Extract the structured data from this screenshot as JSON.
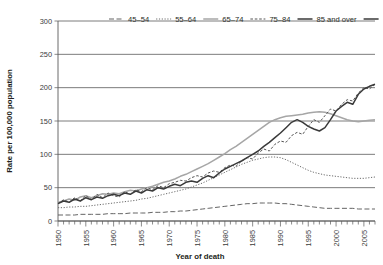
{
  "chart_data": {
    "type": "line",
    "title": "",
    "xlabel": "Year of death",
    "ylabel": "Rate per 100,000 population",
    "xlim": [
      1950,
      2007
    ],
    "ylim": [
      0,
      300
    ],
    "ytick_values": [
      0,
      50,
      100,
      150,
      200,
      250,
      300
    ],
    "ytick_labels": [
      "0",
      "50",
      "100",
      "150",
      "200",
      "250",
      "300"
    ],
    "xtick_labels": [
      "1950",
      "1955",
      "1960",
      "1965",
      "1970",
      "1975",
      "1980",
      "1985",
      "1990",
      "1995",
      "2000",
      "2005"
    ],
    "xtick_values": [
      1950,
      1955,
      1960,
      1965,
      1970,
      1975,
      1980,
      1985,
      1990,
      1995,
      2000,
      2005
    ],
    "minor_tick_step": 1,
    "grid": "horizontal",
    "legend_position": "top",
    "x": [
      1950,
      1951,
      1952,
      1953,
      1954,
      1955,
      1956,
      1957,
      1958,
      1959,
      1960,
      1961,
      1962,
      1963,
      1964,
      1965,
      1966,
      1967,
      1968,
      1969,
      1970,
      1971,
      1972,
      1973,
      1974,
      1975,
      1976,
      1977,
      1978,
      1979,
      1980,
      1981,
      1982,
      1983,
      1984,
      1985,
      1986,
      1987,
      1988,
      1989,
      1990,
      1991,
      1992,
      1993,
      1994,
      1995,
      1996,
      1997,
      1998,
      1999,
      2000,
      2001,
      2002,
      2003,
      2004,
      2005,
      2006,
      2007
    ],
    "series": [
      {
        "name": "45-54",
        "label": "45–54",
        "color": "#5c5c5c",
        "dash": "5,2.5",
        "width": 0.95,
        "values": [
          9,
          9,
          9,
          9,
          10,
          10,
          10,
          10,
          10,
          11,
          11,
          11,
          11,
          12,
          12,
          12,
          12,
          13,
          13,
          13,
          14,
          14,
          15,
          15,
          16,
          17,
          18,
          19,
          20,
          21,
          22,
          23,
          24,
          25,
          26,
          26,
          27,
          27,
          27,
          27,
          26,
          26,
          25,
          24,
          23,
          22,
          21,
          20,
          19,
          19,
          19,
          19,
          19,
          19,
          18,
          18,
          18,
          18
        ]
      },
      {
        "name": "55-64",
        "label": "55–64",
        "color": "#6b6b6b",
        "dash": "1.2,1.6",
        "width": 1.0,
        "values": [
          20,
          20,
          21,
          21,
          22,
          22,
          23,
          24,
          25,
          26,
          27,
          28,
          29,
          30,
          31,
          33,
          34,
          36,
          38,
          40,
          42,
          44,
          46,
          48,
          51,
          54,
          57,
          61,
          65,
          69,
          73,
          77,
          81,
          85,
          88,
          91,
          93,
          95,
          96,
          96,
          95,
          92,
          88,
          84,
          80,
          76,
          73,
          71,
          69,
          68,
          67,
          66,
          65,
          64,
          64,
          64,
          65,
          66
        ]
      },
      {
        "name": "65-74",
        "label": "65–74",
        "color": "#a6a6a6",
        "dash": "none",
        "width": 1.5,
        "values": [
          28,
          30,
          33,
          31,
          36,
          38,
          35,
          38,
          41,
          40,
          42,
          41,
          44,
          46,
          45,
          48,
          50,
          52,
          55,
          58,
          60,
          63,
          67,
          70,
          74,
          78,
          82,
          86,
          91,
          96,
          101,
          107,
          112,
          118,
          124,
          130,
          136,
          142,
          148,
          152,
          155,
          157,
          158,
          159,
          160,
          162,
          163,
          164,
          163,
          161,
          158,
          155,
          152,
          150,
          149,
          150,
          151,
          152
        ]
      },
      {
        "name": "75-84",
        "label": "75–84",
        "color": "#555555",
        "dash": "2.6,1.8",
        "width": 1.0,
        "values": [
          26,
          32,
          28,
          35,
          30,
          38,
          32,
          40,
          35,
          42,
          38,
          36,
          44,
          40,
          47,
          44,
          50,
          47,
          53,
          50,
          56,
          58,
          61,
          60,
          65,
          68,
          66,
          72,
          75,
          73,
          80,
          84,
          82,
          90,
          95,
          93,
          102,
          108,
          105,
          115,
          120,
          118,
          128,
          133,
          130,
          142,
          152,
          148,
          158,
          168,
          165,
          175,
          182,
          180,
          192,
          200,
          198,
          205
        ]
      },
      {
        "name": "85 and over",
        "label": "85 and over",
        "color": "#3a3a3a",
        "dash": "none",
        "width": 1.5,
        "values": [
          26,
          30,
          28,
          33,
          30,
          35,
          32,
          36,
          34,
          38,
          40,
          38,
          42,
          40,
          45,
          42,
          47,
          45,
          50,
          48,
          52,
          55,
          53,
          58,
          60,
          58,
          64,
          68,
          65,
          72,
          78,
          82,
          86,
          90,
          95,
          100,
          105,
          112,
          118,
          125,
          132,
          140,
          148,
          152,
          148,
          142,
          138,
          135,
          140,
          152,
          165,
          172,
          178,
          175,
          190,
          198,
          202,
          205
        ]
      }
    ]
  }
}
